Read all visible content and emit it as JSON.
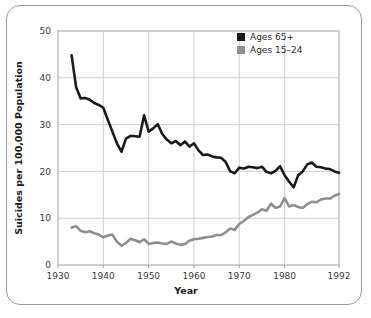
{
  "chart_data": {
    "type": "line",
    "title": "",
    "xlabel": "Year",
    "ylabel": "Suicides per 100,000 Population",
    "xlim": [
      1930,
      1992
    ],
    "ylim": [
      0,
      50
    ],
    "grid": true,
    "legend_position": "top-right",
    "xticks": [
      "1930",
      "1940",
      "1950",
      "1960",
      "1970",
      "1980",
      "1992"
    ],
    "xtick_values": [
      1930,
      1940,
      1950,
      1960,
      1970,
      1980,
      1992
    ],
    "yticks": [
      "0",
      "10",
      "20",
      "30",
      "40",
      "50"
    ],
    "ytick_values": [
      0,
      10,
      20,
      30,
      40,
      50
    ],
    "x": [
      1933,
      1934,
      1935,
      1936,
      1937,
      1938,
      1939,
      1940,
      1941,
      1942,
      1943,
      1944,
      1945,
      1946,
      1947,
      1948,
      1949,
      1950,
      1951,
      1952,
      1953,
      1954,
      1955,
      1956,
      1957,
      1958,
      1959,
      1960,
      1961,
      1962,
      1963,
      1964,
      1965,
      1966,
      1967,
      1968,
      1969,
      1970,
      1971,
      1972,
      1973,
      1974,
      1975,
      1976,
      1977,
      1978,
      1979,
      1980,
      1981,
      1982,
      1983,
      1984,
      1985,
      1986,
      1987,
      1988,
      1989,
      1990,
      1991,
      1992
    ],
    "series": [
      {
        "name": "Ages 65+",
        "color": "#1a1a1a",
        "values": [
          44.8,
          38.0,
          35.6,
          35.7,
          35.3,
          34.6,
          34.2,
          33.6,
          31.0,
          28.5,
          26.0,
          24.2,
          27.0,
          27.6,
          27.5,
          27.4,
          32.0,
          28.5,
          29.2,
          30.1,
          28.0,
          26.8,
          26.0,
          26.5,
          25.6,
          26.4,
          25.3,
          26.0,
          24.5,
          23.5,
          23.6,
          23.2,
          23.0,
          22.9,
          22.0,
          20.0,
          19.6,
          20.8,
          20.6,
          21.0,
          20.9,
          20.7,
          21.0,
          19.9,
          19.6,
          20.1,
          21.1,
          19.2,
          17.8,
          16.6,
          19.2,
          20.0,
          21.5,
          21.9,
          21.0,
          20.9,
          20.6,
          20.5,
          20.0,
          19.7
        ]
      },
      {
        "name": "Ages 15–24",
        "color": "#8e8e8e",
        "values": [
          8.0,
          8.3,
          7.3,
          7.0,
          7.2,
          6.8,
          6.5,
          5.9,
          6.3,
          6.5,
          5.0,
          4.1,
          4.7,
          5.6,
          5.3,
          4.9,
          5.5,
          4.5,
          4.7,
          4.8,
          4.6,
          4.5,
          5.0,
          4.6,
          4.3,
          4.5,
          5.2,
          5.5,
          5.6,
          5.8,
          6.0,
          6.1,
          6.4,
          6.4,
          7.0,
          7.8,
          7.5,
          8.8,
          9.4,
          10.2,
          10.7,
          11.2,
          11.9,
          11.6,
          13.1,
          12.2,
          12.5,
          14.3,
          12.5,
          12.8,
          12.4,
          12.2,
          13.0,
          13.5,
          13.4,
          14.0,
          14.2,
          14.2,
          14.8,
          15.2
        ]
      }
    ]
  },
  "legend": {
    "items": [
      {
        "label": "Ages 65+",
        "color": "#1a1a1a"
      },
      {
        "label": "Ages 15–24",
        "color": "#8e8e8e"
      }
    ]
  }
}
